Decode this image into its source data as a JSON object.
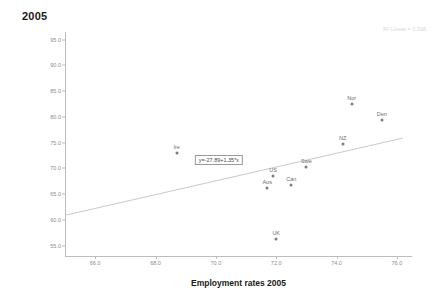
{
  "chart_data": {
    "type": "scatter",
    "title": "2005",
    "xlabel": "Employment rates 2005",
    "ylabel": "Non-financial employment com 2005",
    "xlim": [
      65.0,
      76.5
    ],
    "ylim": [
      53.0,
      96.5
    ],
    "xticks": [
      "66.0",
      "68.0",
      "70.0",
      "72.0",
      "74.0",
      "76.0"
    ],
    "xtick_values": [
      66.0,
      68.0,
      70.0,
      72.0,
      74.0,
      76.0
    ],
    "yticks": [
      "55.0",
      "60.0",
      "65.0",
      "70.0",
      "75.0",
      "80.0",
      "85.0",
      "90.0",
      "95.0"
    ],
    "ytick_values": [
      55.0,
      60.0,
      65.0,
      70.0,
      75.0,
      80.0,
      85.0,
      90.0,
      95.0
    ],
    "grid": false,
    "legend": "none",
    "points": [
      {
        "label": "Ire",
        "x": 68.7,
        "y": 73.0
      },
      {
        "label": "Aus",
        "x": 71.7,
        "y": 66.2
      },
      {
        "label": "US",
        "x": 71.9,
        "y": 68.6
      },
      {
        "label": "UK",
        "x": 72.0,
        "y": 56.3
      },
      {
        "label": "Can",
        "x": 72.5,
        "y": 66.7
      },
      {
        "label": "Swe",
        "x": 73.0,
        "y": 70.2
      },
      {
        "label": "NZ",
        "x": 74.2,
        "y": 74.8
      },
      {
        "label": "Nor",
        "x": 74.5,
        "y": 82.5
      },
      {
        "label": "Den",
        "x": 75.5,
        "y": 79.5
      }
    ],
    "fit_line": {
      "type": "linear",
      "intercept": -27.89,
      "slope": 1.35,
      "x_start": 65.0,
      "y_start": 60.9,
      "x_end": 76.2,
      "y_end": 75.9
    },
    "annotations": {
      "equation": "y=-27.89+1.35*x",
      "equation_x": 70.1,
      "equation_y": 71.6,
      "r_squared": "R² Linear = 0.208"
    },
    "colors": {
      "point": "#7d7d7d",
      "line": "#c9c9c9",
      "axis": "#bdbdbd",
      "tick_text": "#8c8c8c",
      "title_text": "#1a1a1a",
      "r2_text": "#d8d8d8"
    }
  }
}
